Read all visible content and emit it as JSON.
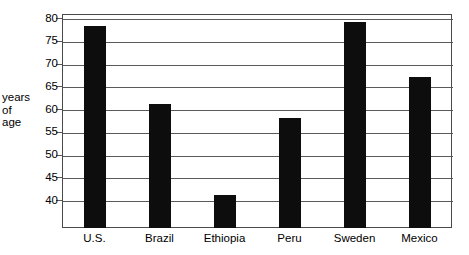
{
  "chart_data": {
    "type": "bar",
    "title": "",
    "subtitle": "",
    "xlabel": "",
    "ylabel": "years of age",
    "ylabel_lines": [
      "years",
      "of",
      "age"
    ],
    "categories": [
      "U.S.",
      "Brazil",
      "Ethiopia",
      "Peru",
      "Sweden",
      "Mexico"
    ],
    "values": [
      78.3,
      61.3,
      41.2,
      58.2,
      79.3,
      67.2
    ],
    "ylim": [
      34,
      81
    ],
    "yticks": [
      80,
      75,
      70,
      65,
      60,
      55,
      50,
      45,
      40
    ],
    "ytick_labels": [
      "80",
      "75",
      "70",
      "65",
      "60",
      "55",
      "50",
      "45",
      "40"
    ],
    "grid": true,
    "grid_axis": "y",
    "legend": false,
    "legend_position": "none",
    "bar_color": "#0d0d0d",
    "frame_color": "#4a4a4a",
    "background": "#ffffff"
  }
}
